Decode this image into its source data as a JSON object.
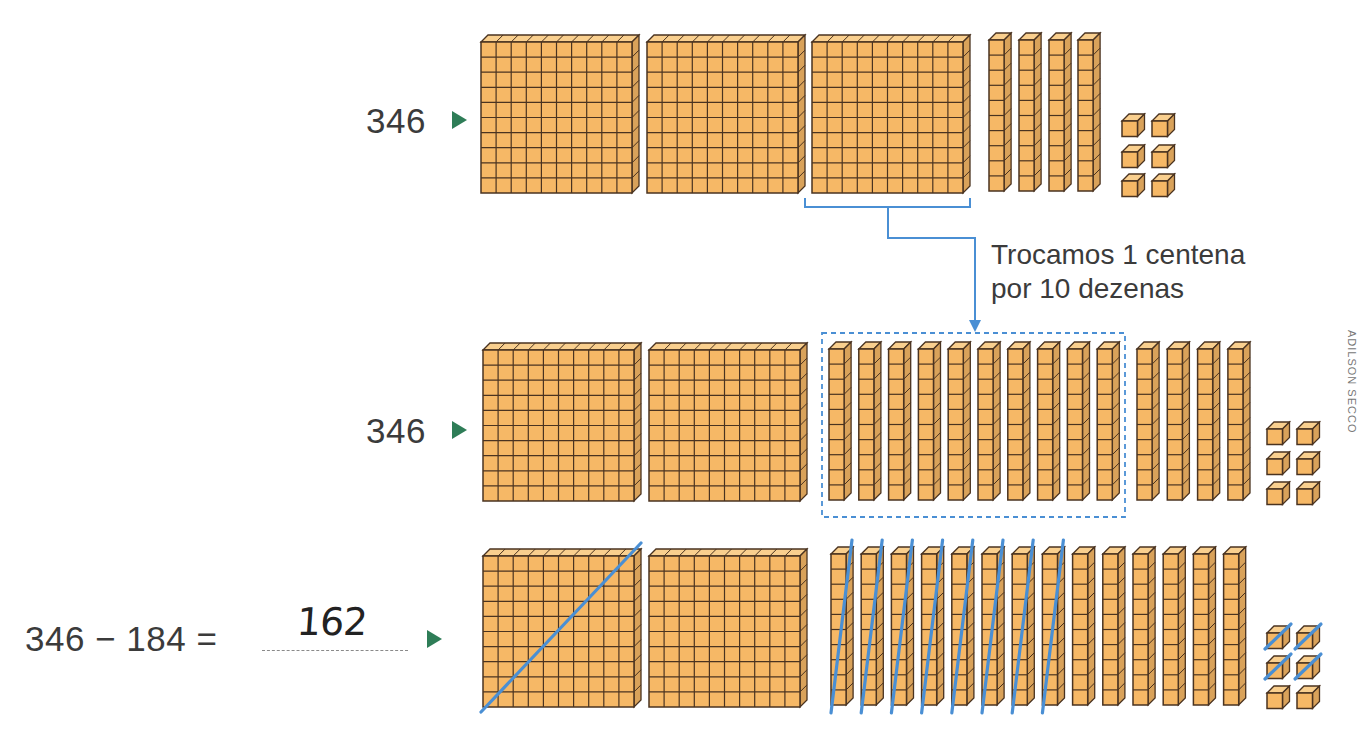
{
  "colors": {
    "block_face": "#f6b866",
    "block_top": "#f9cf8e",
    "block_side": "#d9a25a",
    "block_outline": "#4a3320",
    "accent_blue": "#4a8fd4",
    "marker_green": "#2e7d57",
    "text": "#3b3b3b"
  },
  "row1": {
    "label": "346",
    "marker_icon": "play-triangle-icon",
    "flats": 3,
    "rods": 4,
    "units": 6
  },
  "exchange": {
    "caption_line1": "Trocamos 1 centena",
    "caption_line2": "por 10 dezenas"
  },
  "row2": {
    "label": "346",
    "marker_icon": "play-triangle-icon",
    "flats": 2,
    "rods_exchanged": 10,
    "rods_original": 4,
    "units": 6
  },
  "row3": {
    "equation": "346 − 184 =",
    "answer": "162",
    "marker_icon": "play-triangle-icon",
    "flats": 2,
    "flats_crossed": 1,
    "rods": 14,
    "rods_crossed": 8,
    "units": 6,
    "units_crossed": 4
  },
  "credit": "ADILSON SECCO"
}
